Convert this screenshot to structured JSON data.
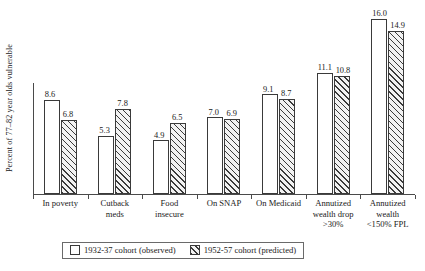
{
  "chart_data": {
    "type": "bar",
    "title": "",
    "xlabel": "",
    "ylabel": "Percent of 77–82 year olds vulnerable",
    "ylim": [
      0,
      17.5
    ],
    "grid": false,
    "legend_position": "bottom",
    "categories": [
      "In poverty",
      "Cutback meds",
      "Food insecure",
      "On SNAP",
      "On Medicaid",
      "Annutized wealth drop >30%",
      "Annutized wealth <150% FPL"
    ],
    "category_lines": [
      [
        "In poverty"
      ],
      [
        "Cutback",
        "meds"
      ],
      [
        "Food",
        "insecure"
      ],
      [
        "On SNAP"
      ],
      [
        "On Medicaid"
      ],
      [
        "Annutized",
        "wealth drop",
        ">30%"
      ],
      [
        "Annutized",
        "wealth",
        "<150% FPL"
      ]
    ],
    "series": [
      {
        "name": "1932-37 cohort (observed)",
        "style": "open",
        "values": [
          8.6,
          5.3,
          4.9,
          7.0,
          9.1,
          11.1,
          16.0
        ],
        "labels": [
          "8.6",
          "5.3",
          "4.9",
          "7.0",
          "9.1",
          "11.1",
          "16.0"
        ]
      },
      {
        "name": "1952-57 cohort (predicted)",
        "style": "hatched",
        "values": [
          6.8,
          7.8,
          6.5,
          6.9,
          8.7,
          10.8,
          14.9
        ],
        "labels": [
          "6.8",
          "7.8",
          "6.5",
          "6.9",
          "8.7",
          "10.8",
          "14.9"
        ]
      }
    ]
  },
  "legend": {
    "items": [
      {
        "label": "1932-37 cohort (observed)",
        "swatch": "open-square-swatch"
      },
      {
        "label": "1952-57 cohort (predicted)",
        "swatch": "hatched-square-swatch"
      }
    ]
  }
}
